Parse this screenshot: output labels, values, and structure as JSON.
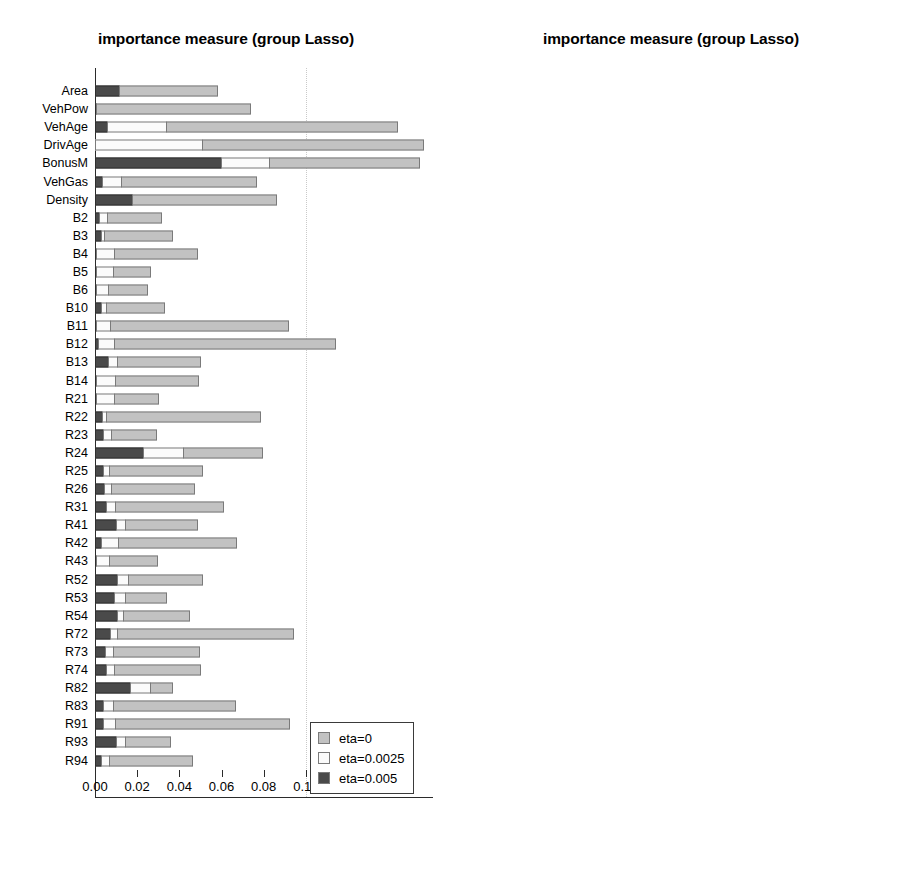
{
  "colors": {
    "eta0": "#c2c2c2",
    "eta0025": "#fbfbfb",
    "eta005": "#4a4a4a",
    "axis": "#2b2b2b",
    "grid": "#c9c9c9",
    "refline": "#000000"
  },
  "legend": {
    "items": [
      {
        "label": "eta=0",
        "swatch": "eta0"
      },
      {
        "label": "eta=0.0025",
        "swatch": "eta0025"
      },
      {
        "label": "eta=0.005",
        "swatch": "eta005"
      }
    ]
  },
  "chart_data": [
    {
      "id": "left",
      "type": "bar",
      "orientation": "horizontal",
      "stacked": true,
      "title": "importance measure (group Lasso)",
      "xlabel": "",
      "ylabel": "",
      "xlim": [
        0.0,
        0.1565
      ],
      "grid": true,
      "gridlines": [
        0.1
      ],
      "reference_line": null,
      "legend_position": "bottom-right",
      "xticks": [
        0.0,
        0.02,
        0.04,
        0.06,
        0.08,
        0.1,
        0.12,
        0.14
      ],
      "xticklabels": [
        "0.00",
        "0.02",
        "0.04",
        "0.06",
        "0.08",
        "0.10",
        "0.12",
        "0.14"
      ],
      "categories": [
        "Area",
        "VehPow",
        "VehAge",
        "DrivAge",
        "BonusM",
        "VehGas",
        "Density",
        "B2",
        "B3",
        "B4",
        "B5",
        "B6",
        "B10",
        "B11",
        "B12",
        "B13",
        "B14",
        "R21",
        "R22",
        "R23",
        "R24",
        "R25",
        "R26",
        "R31",
        "R41",
        "R42",
        "R43",
        "R52",
        "R53",
        "R54",
        "R72",
        "R73",
        "R74",
        "R82",
        "R83",
        "R91",
        "R93",
        "R94"
      ],
      "series": [
        {
          "name": "eta=0.005",
          "values": [
            0.0118,
            0.001,
            0.0062,
            0.0,
            0.06,
            0.0038,
            0.018,
            0.0024,
            0.0032,
            0.001,
            0.0006,
            0.0004,
            0.0032,
            0.001,
            0.002,
            0.0066,
            0.0008,
            0.0008,
            0.004,
            0.0044,
            0.0234,
            0.0042,
            0.0046,
            0.0056,
            0.0104,
            0.0034,
            0.0006,
            0.011,
            0.0094,
            0.0108,
            0.0074,
            0.0052,
            0.0056,
            0.017,
            0.0044,
            0.0042,
            0.0106,
            0.0032
          ]
        },
        {
          "name": "eta=0.0025",
          "values": [
            0.0,
            0.0,
            0.0282,
            0.051,
            0.0236,
            0.0096,
            0.0,
            0.0044,
            0.002,
            0.0092,
            0.0086,
            0.0062,
            0.0028,
            0.0072,
            0.008,
            0.0046,
            0.0096,
            0.0092,
            0.002,
            0.004,
            0.0192,
            0.0034,
            0.0038,
            0.005,
            0.005,
            0.0084,
            0.0066,
            0.0056,
            0.006,
            0.0036,
            0.004,
            0.0042,
            0.0044,
            0.0098,
            0.005,
            0.0062,
            0.0044,
            0.0044
          ]
        },
        {
          "name": "eta=0",
          "values": [
            0.0468,
            0.0736,
            0.1102,
            0.1055,
            0.0714,
            0.0646,
            0.069,
            0.026,
            0.0328,
            0.0396,
            0.0178,
            0.019,
            0.0282,
            0.085,
            0.1052,
            0.04,
            0.0398,
            0.0212,
            0.0736,
            0.0222,
            0.0382,
            0.0444,
            0.04,
            0.0514,
            0.0344,
            0.0564,
            0.0234,
            0.0358,
            0.0198,
            0.0318,
            0.0838,
            0.0414,
            0.0412,
            0.0112,
            0.0582,
            0.0828,
            0.022,
            0.0396
          ]
        }
      ]
    },
    {
      "id": "right",
      "type": "bar",
      "orientation": "horizontal",
      "stacked": true,
      "title": "importance measure (group Lasso)",
      "xlabel": "",
      "ylabel": "",
      "xlim": [
        0.0,
        0.1565
      ],
      "grid": true,
      "gridlines": [
        0.1
      ],
      "reference_line": 0.005,
      "legend_position": "bottom-right",
      "xticks": [
        0.0,
        0.02,
        0.04,
        0.06,
        0.08,
        0.1,
        0.12,
        0.14
      ],
      "xticklabels": [
        "0.00",
        "0.02",
        "0.04",
        "0.06",
        "0.08",
        "0.10",
        "0.12",
        "0.14"
      ],
      "categories": [
        "Area",
        "VehPow",
        "VehAge",
        "DrivAge",
        "BonusM",
        "VehGas",
        "Density",
        "B2",
        "B3",
        "B4",
        "B5",
        "B6",
        "B10",
        "B11",
        "B12",
        "B13",
        "B14",
        "R21",
        "R22",
        "R23",
        "R24",
        "R25",
        "R26",
        "R31",
        "R41",
        "R42",
        "R43",
        "R52",
        "R53",
        "R54",
        "R72",
        "R73",
        "R74",
        "R82",
        "R83",
        "R91",
        "R93",
        "R94"
      ],
      "series": [
        {
          "name": "eta=0.005",
          "values": [
            0.0296,
            0.0026,
            0.0418,
            0.054,
            0.082,
            0.003,
            0.04,
            0.0026,
            0.0018,
            0.005,
            0.0026,
            0.0016,
            0.0048,
            0.0046,
            0.0054,
            0.0052,
            0.003,
            0.0028,
            0.0028,
            0.0028,
            0.0032,
            0.003,
            0.005,
            0.0034,
            0.0034,
            0.003,
            0.003,
            0.0026,
            0.0028,
            0.0034,
            0.003,
            0.003,
            0.003,
            0.0046,
            0.004,
            0.003,
            0.0028,
            0.0032
          ]
        },
        {
          "name": "eta=0.0025",
          "values": [
            0.0,
            0.0024,
            0.012,
            0.08,
            0.0064,
            0.0056,
            0.0046,
            0.0044,
            0.0066,
            0.01,
            0.002,
            0.003,
            0.0026,
            0.0066,
            0.0356,
            0.0048,
            0.002,
            0.003,
            0.003,
            0.003,
            0.0034,
            0.0048,
            0.0028,
            0.003,
            0.0034,
            0.0034,
            0.0036,
            0.0038,
            0.003,
            0.0034,
            0.0036,
            0.003,
            0.003,
            0.0022,
            0.0026,
            0.0028,
            0.0038,
            0.003
          ]
        },
        {
          "name": "eta=0",
          "values": [
            0.006,
            0.052,
            0.073,
            0.0,
            0.068,
            0.0762,
            0.0618,
            0.0158,
            0.014,
            0.017,
            0.0244,
            0.014,
            0.0076,
            0.0208,
            0.074,
            0.043,
            0.0578,
            0.0072,
            0.033,
            0.0272,
            0.007,
            0.0202,
            0.0356,
            0.023,
            0.038,
            0.0196,
            0.02,
            0.018,
            0.0344,
            0.023,
            0.0218,
            0.029,
            0.0388,
            0.019,
            0.0202,
            0.0242,
            0.018,
            0.018
          ]
        }
      ]
    }
  ]
}
